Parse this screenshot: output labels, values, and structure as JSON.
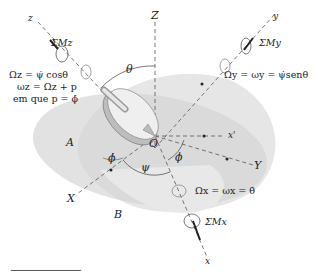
{
  "figure": {
    "axes": {
      "Z": "Z",
      "X": "X",
      "Y": "Y",
      "x": "x",
      "y": "y",
      "z": "z",
      "x_prime": "x'",
      "O": "O",
      "A": "A",
      "B": "B"
    },
    "angles": {
      "theta": "θ",
      "psi": "ψ",
      "phi": "ϕ",
      "phi_dot": "ϕ̇"
    },
    "moments": {
      "Mz": "ΣMz",
      "My": "ΣMy",
      "Mx": "ΣMx"
    },
    "equations": {
      "omega_z_big": "Ωz = ψ̇ cosθ",
      "omega_z_small": "ωz = Ωz + p",
      "p_def": "em que p = ϕ̇",
      "omega_y": "Ωy = ωy = ψ̇senθ",
      "omega_x": "Ωx = ωx = θ̇"
    },
    "colors": {
      "plane": "#dcdcdc",
      "plane_dark": "#c8c8c8",
      "line": "#555555",
      "text": "#222222"
    }
  }
}
